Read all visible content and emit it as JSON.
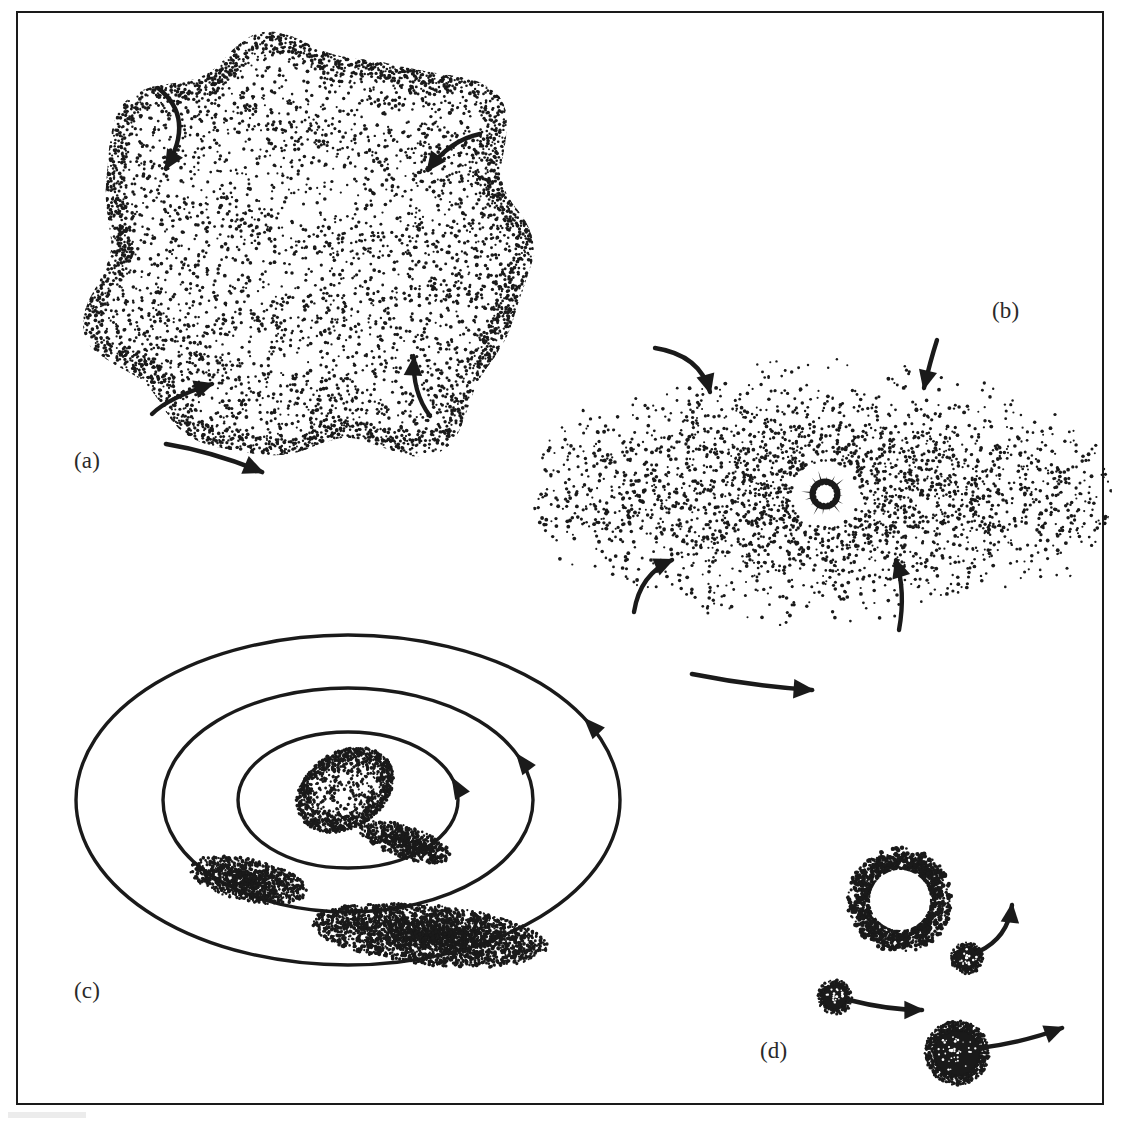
{
  "figure": {
    "kind": "scientific-line-drawing",
    "title_visible": false,
    "background_color": "#ffffff",
    "ink_color": "#1a1a1a",
    "frame": {
      "present": true,
      "x": 16,
      "y": 11,
      "width": 1088,
      "height": 1094,
      "stroke_color": "#1a1a1a",
      "stroke_width": 2
    },
    "width": 1121,
    "height": 1125,
    "panel_count": 4
  },
  "labels": {
    "a": "(a)",
    "b": "(b)",
    "c": "(c)",
    "d": "(d)"
  },
  "panels": [
    {
      "id": "a",
      "label": "(a)",
      "label_x": 74,
      "label_y": 448,
      "description": "irregular stippled contracting gas-and-dust cloud with lobed clumps",
      "shape": "irregular-blob",
      "center_x": 310,
      "center_y": 250,
      "radius_x": 222,
      "radius_y": 212,
      "stipple_dots": 7200,
      "arrows": [
        {
          "name": "rotation-arrow-top-left",
          "type": "curved",
          "x1": 158,
          "y1": 88,
          "cx": 196,
          "cy": 118,
          "x2": 166,
          "y2": 168,
          "head": "down"
        },
        {
          "name": "rotation-arrow-top-right",
          "type": "curved",
          "x1": 480,
          "y1": 134,
          "cx": 450,
          "cy": 140,
          "x2": 428,
          "y2": 170,
          "head": "down-left"
        },
        {
          "name": "rotation-arrow-bottom-left",
          "type": "curved",
          "x1": 152,
          "y1": 414,
          "cx": 168,
          "cy": 398,
          "x2": 212,
          "y2": 384,
          "head": "up-right"
        },
        {
          "name": "rotation-arrow-bottom-right",
          "type": "curved",
          "x1": 430,
          "y1": 416,
          "cx": 412,
          "cy": 392,
          "x2": 414,
          "y2": 358,
          "head": "up"
        },
        {
          "name": "spin-direction-arrow",
          "type": "curved",
          "x1": 166,
          "y1": 444,
          "cx": 214,
          "cy": 452,
          "x2": 262,
          "y2": 472,
          "head": "right-down"
        }
      ]
    },
    {
      "id": "b",
      "label": "(b)",
      "label_x": 992,
      "label_y": 298,
      "description": "flattened rotating protoplanetary disk with dense midplane and central protostar",
      "shape": "ellipse",
      "center_x": 822,
      "center_y": 493,
      "radius_x": 290,
      "radius_y": 163,
      "stipple_dots": 9000,
      "protostar": {
        "name": "protostar",
        "center_x": 825,
        "center_y": 494,
        "clear_gap_radius": 33,
        "burst_outer_radius": 24,
        "burst_inner_radius": 9,
        "spike_count": 16,
        "core_hole_radius": 7
      },
      "arrows": [
        {
          "name": "infall-arrow-top-left",
          "type": "curved",
          "x1": 655,
          "y1": 348,
          "cx": 700,
          "cy": 355,
          "x2": 710,
          "y2": 392,
          "head": "down"
        },
        {
          "name": "infall-arrow-top-right",
          "type": "curved",
          "x1": 937,
          "y1": 340,
          "cx": 930,
          "cy": 362,
          "x2": 924,
          "y2": 388,
          "head": "down"
        },
        {
          "name": "infall-arrow-bottom-left",
          "type": "curved",
          "x1": 634,
          "y1": 612,
          "cx": 640,
          "cy": 574,
          "x2": 672,
          "y2": 560,
          "head": "up-right"
        },
        {
          "name": "infall-arrow-bottom-right",
          "type": "curved",
          "x1": 899,
          "y1": 630,
          "cx": 906,
          "cy": 592,
          "x2": 896,
          "y2": 560,
          "head": "up"
        },
        {
          "name": "disk-spin-direction-arrow",
          "type": "curved",
          "x1": 692,
          "y1": 674,
          "cx": 752,
          "cy": 686,
          "x2": 812,
          "y2": 690,
          "head": "right"
        }
      ]
    },
    {
      "id": "c",
      "label": "(c)",
      "label_x": 74,
      "label_y": 978,
      "description": "concentric orbital rings with dust clumps coalescing into planetesimals around a central protoplanet",
      "shape": "concentric-ellipses",
      "center_x": 348,
      "center_y": 800,
      "rings": [
        {
          "name": "orbit-ring-outer",
          "radius_x": 272,
          "radius_y": 165,
          "arrow_angle_deg": 330
        },
        {
          "name": "orbit-ring-middle",
          "radius_x": 185,
          "radius_y": 112,
          "arrow_angle_deg": 335
        },
        {
          "name": "orbit-ring-inner",
          "radius_x": 110,
          "radius_y": 68,
          "arrow_angle_deg": 340
        }
      ],
      "central_body": {
        "name": "protoplanet-core",
        "center_x": 345,
        "center_y": 790,
        "radius_x": 52,
        "radius_y": 38,
        "rotation_deg": -32
      },
      "dust_clumps": [
        {
          "name": "dust-clump-inner",
          "center_x": 405,
          "center_y": 842,
          "radius_x": 48,
          "radius_y": 16,
          "rotation_deg": 18
        },
        {
          "name": "dust-clump-middle",
          "center_x": 248,
          "center_y": 880,
          "radius_x": 60,
          "radius_y": 21,
          "rotation_deg": 12
        },
        {
          "name": "dust-clump-outer",
          "center_x": 430,
          "center_y": 935,
          "radius_x": 118,
          "radius_y": 30,
          "rotation_deg": 6
        }
      ]
    },
    {
      "id": "d",
      "label": "(d)",
      "label_x": 760,
      "label_y": 1038,
      "description": "young star cleared of gas with remnant dust ring and formed planets moving on orbits",
      "star_ring": {
        "name": "young-star-with-dust-ring",
        "center_x": 900,
        "center_y": 900,
        "clear_radius": 30,
        "dust_inner_radius": 30,
        "dust_outer_radius": 48,
        "stipple_dots": 620
      },
      "bodies": [
        {
          "name": "planet-small-upper",
          "center_x": 967,
          "center_y": 958,
          "radius": 12,
          "arrow": {
            "name": "planet-motion-arrow-upper",
            "x1": 978,
            "y1": 952,
            "cx": 1008,
            "cy": 938,
            "x2": 1012,
            "y2": 905,
            "head": "up-right"
          }
        },
        {
          "name": "planet-small-left",
          "center_x": 835,
          "center_y": 997,
          "radius": 13,
          "arrow": {
            "name": "planet-motion-arrow-left",
            "x1": 849,
            "y1": 1000,
            "cx": 888,
            "cy": 1010,
            "x2": 922,
            "y2": 1010,
            "head": "right"
          }
        },
        {
          "name": "planet-large-lower",
          "center_x": 957,
          "center_y": 1053,
          "radius": 24,
          "arrow": {
            "name": "planet-motion-arrow-lower",
            "x1": 980,
            "y1": 1048,
            "cx": 1025,
            "cy": 1042,
            "x2": 1062,
            "y2": 1028,
            "head": "up-right"
          }
        }
      ]
    }
  ]
}
